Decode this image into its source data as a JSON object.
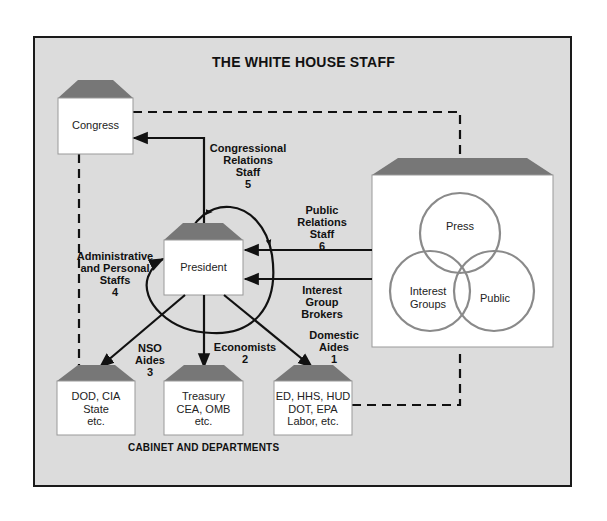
{
  "title": "THE WHITE HOUSE STAFF",
  "footer": "CABINET AND DEPARTMENTS",
  "colors": {
    "background": "#dcdcdc",
    "roof": "#777777",
    "box": "#ffffff",
    "circle": "#8a8a8a",
    "line": "#111111"
  },
  "nodes": {
    "congress": "Congress",
    "president": "President",
    "press": "Press",
    "interest_groups": "Interest\nGroups",
    "public": "Public",
    "dod": "DOD, CIA\nState\netc.",
    "treasury": "Treasury\nCEA, OMB\netc.",
    "domestic": "ED, HHS, HUD\nDOT, EPA\nLabor, etc."
  },
  "labels": {
    "congressional": "Congressional\nRelations\nStaff\n5",
    "public_relations": "Public\nRelations\nStaff\n6",
    "admin": "Administrative\nand Personal\nStaffs\n4",
    "interest_brokers": "Interest\nGroup\nBrokers",
    "domestic_aides": "Domestic\nAides\n1",
    "economists": "Economists\n2",
    "nso": "NSO\nAides\n3"
  }
}
